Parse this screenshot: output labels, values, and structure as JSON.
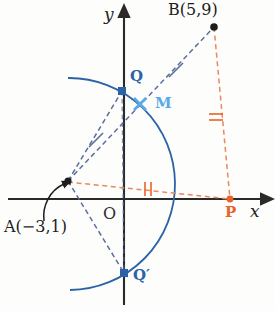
{
  "figure": {
    "background_color": "#fdfdfc"
  },
  "colors": {
    "axis": "#2a2a2a",
    "blue_dark": "#2b63a6",
    "blue_light": "#5aa9e6",
    "blue_dash": "#5a6f9e",
    "orange": "#e8622a",
    "orange_dash": "#e8885c",
    "text": "#1d1d1d"
  },
  "axes": {
    "x_label": "x",
    "y_label": "y",
    "origin_label": "O",
    "x_axis_y": 199,
    "y_axis_x": 124,
    "x_start": 8,
    "x_end": 268,
    "y_start": 10,
    "y_end": 305
  },
  "points": [
    {
      "id": "A",
      "label": "A(−3,1)",
      "marker": "dot",
      "color": "#1d1d1d",
      "x": 68,
      "y": 181,
      "coords": {
        "x": -3,
        "y": 1
      },
      "label_x": 4,
      "label_y": 220
    },
    {
      "id": "B",
      "label": "B(5,9)",
      "marker": "dot",
      "color": "#1d1d1d",
      "x": 214,
      "y": 27,
      "coords": {
        "x": 5,
        "y": 9
      },
      "label_x": 168,
      "label_y": 2
    },
    {
      "id": "M",
      "label": "M",
      "marker": "cross",
      "color": "#5aa9e6",
      "x": 140,
      "y": 104,
      "label_x": 155,
      "label_y": 96
    },
    {
      "id": "P",
      "label": "P",
      "marker": "dot",
      "color": "#e8622a",
      "x": 230,
      "y": 199,
      "label_x": 225,
      "label_y": 206
    },
    {
      "id": "Q",
      "label": "Q",
      "marker": "square",
      "color": "#2b63a6",
      "x": 122,
      "y": 91,
      "label_x": 130,
      "label_y": 70
    },
    {
      "id": "Qprime",
      "label": "Q′",
      "marker": "square",
      "color": "#2b63a6",
      "x": 124,
      "y": 273,
      "label_x": 133,
      "label_y": 269
    }
  ],
  "segments": [
    {
      "id": "A-Q",
      "from": "A",
      "to": "Q",
      "style": "dashed",
      "color": "#5a6f9e"
    },
    {
      "id": "A-Qprime",
      "from": "A",
      "to": "Qprime",
      "style": "dashed",
      "color": "#5a6f9e"
    },
    {
      "id": "A-B",
      "from": "A",
      "to": "B",
      "style": "dashed",
      "color": "#5a6f9e"
    },
    {
      "id": "A-P",
      "from": "A",
      "to": "P",
      "style": "dashed",
      "color": "#e8885c"
    },
    {
      "id": "B-P",
      "from": "B",
      "to": "P",
      "style": "dashed",
      "color": "#e8885c"
    }
  ],
  "arc": {
    "id": "arc-QQprime",
    "description": "circular arc centred at A through Q and Q′",
    "color": "#2b63a6",
    "center_x": 68,
    "center_y": 181,
    "radius": 103,
    "start_x": 68,
    "start_y": 78,
    "end_x": 70,
    "end_y": 290
  },
  "tick_marks": [
    {
      "id": "tick-A-M",
      "on": "A-B",
      "count": 1,
      "color": "#5a6f9e",
      "x": 96,
      "y": 140
    },
    {
      "id": "tick-M-B",
      "on": "A-B",
      "count": 1,
      "color": "#5a6f9e",
      "x": 176,
      "y": 70
    },
    {
      "id": "tick-A-P",
      "on": "A-P",
      "count": 2,
      "color": "#e8622a",
      "x": 148,
      "y": 189
    },
    {
      "id": "tick-B-P",
      "on": "B-P",
      "count": 2,
      "color": "#e8622a",
      "x": 216,
      "y": 117
    }
  ],
  "annotation_arrow": {
    "id": "arrow-to-A",
    "description": "curved pointer from the A label up to point A",
    "color": "#1d1d1d",
    "tail_x": 44,
    "tail_y": 214,
    "head_x": 66,
    "head_y": 183
  }
}
